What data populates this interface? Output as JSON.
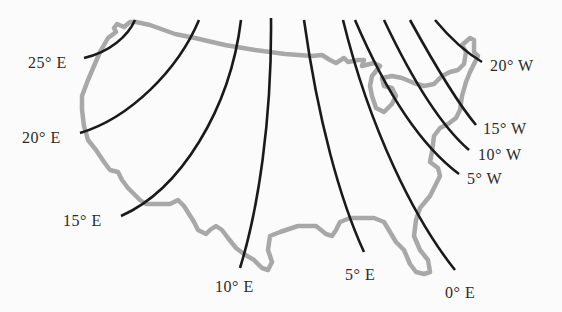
{
  "diagram": {
    "type": "isogonic-map",
    "region": "contiguous-united-states",
    "colors": {
      "background": "#fbfbfb",
      "boundary": "#a8a8a8",
      "lines": "#1a1a1a",
      "labels": "#2a2a2a"
    },
    "lines": [
      {
        "id": "e25",
        "label": "25° E",
        "path": "M135,20 C128,36 110,52 84,58",
        "lx": 28,
        "ly": 68
      },
      {
        "id": "e20",
        "label": "20° E",
        "path": "M199,20 C178,70 130,118 80,133",
        "lx": 22,
        "ly": 143
      },
      {
        "id": "e15",
        "label": "15° E",
        "path": "M241,20 C230,110 180,190 121,216",
        "lx": 63,
        "ly": 226
      },
      {
        "id": "e10",
        "label": "10° E",
        "path": "M271,18 C272,120 258,210 240,268",
        "lx": 215,
        "ly": 292
      },
      {
        "id": "e05",
        "label": "5° E",
        "path": "M304,20 C318,120 340,200 364,252",
        "lx": 345,
        "ly": 280
      },
      {
        "id": "e00",
        "label": "0° E",
        "path": "M343,20 C370,130 415,220 455,270",
        "lx": 445,
        "ly": 298
      },
      {
        "id": "w05",
        "label": "5° W",
        "path": "M355,20 C385,90 420,145 459,174",
        "lx": 467,
        "ly": 184
      },
      {
        "id": "w10",
        "label": "10° W",
        "path": "M384,20 C410,75 440,125 469,150",
        "lx": 478,
        "ly": 160
      },
      {
        "id": "w15",
        "label": "15° W",
        "path": "M410,20 C432,60 455,100 476,125",
        "lx": 483,
        "ly": 134
      },
      {
        "id": "w20",
        "label": "20° W",
        "path": "M435,20 C450,38 465,52 482,62",
        "lx": 490,
        "ly": 71
      }
    ],
    "boundary_path": "M116,32 L114,28 L117,24 L124,27 L130,22 L136,22 L150,25 L175,34 L195,38 L225,45 L255,50 L285,54 L312,56 L322,55 L330,60 L336,63 L344,58 L348,62 L358,60 L364,60 L362,66 L374,63 L380,66 L372,76 L370,86 L372,96 L376,108 L384,112 L392,104 L396,96 L392,88 L384,86 L382,78 L392,76 L402,78 L414,83 L424,86 L434,84 L442,76 L450,72 L458,70 L464,64 L466,52 L462,45 L470,38 L474,40 L474,52 L478,56 L474,64 L470,72 L466,82 L462,96 L460,110 L456,118 L448,124 L440,128 L434,136 L432,152 L430,162 L438,168 L440,176 L436,184 L430,196 L420,208 L416,220 L414,236 L420,250 L428,260 L430,272 L424,274 L416,272 L410,264 L404,250 L396,242 L384,222 L374,218 L350,218 L340,222 L336,230 L332,236 L326,234 L316,226 L298,226 L280,232 L270,236 L268,250 L272,262 L268,270 L262,268 L254,260 L244,254 L236,248 L228,238 L222,230 L216,226 L210,230 L206,234 L198,230 L194,222 L184,206 L178,200 L170,204 L160,204 L146,204 L140,200 L128,188 L122,180 L118,172 L110,170 L104,162 L96,150 L88,140 L84,126 L82,110 L82,96 L88,80 L94,66 L100,52 L108,38 Z"
  }
}
